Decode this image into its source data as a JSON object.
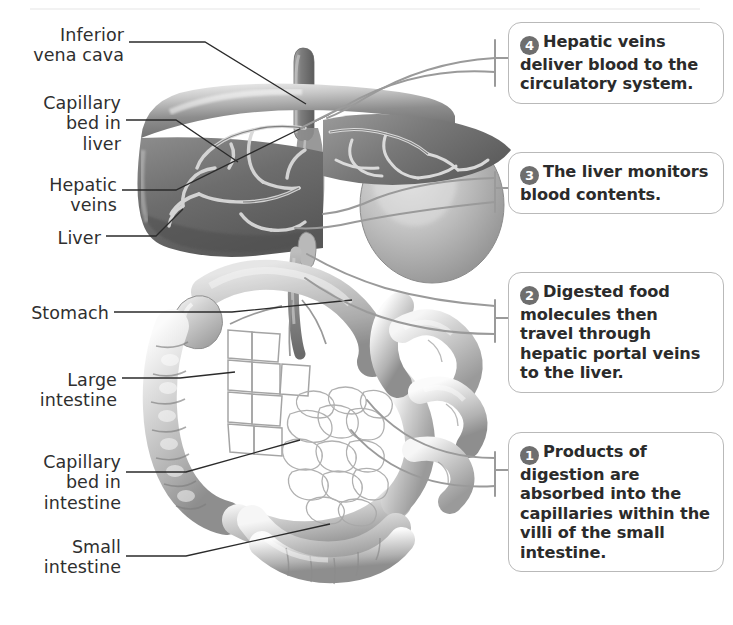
{
  "figure": {
    "background_color": "#ffffff",
    "label_color": "#2f2f2f",
    "badge_color": "#6e6e6e",
    "callout_border_color": "#b9b9b9",
    "leader_line_color": "#2b2b2b",
    "callout_leader_color": "#8c8c8c"
  },
  "labels": [
    {
      "id": "inferior-vena-cava",
      "text": "Inferior\nvena cava"
    },
    {
      "id": "capillary-bed-in-liver",
      "text": "Capillary\nbed in\nliver"
    },
    {
      "id": "hepatic-veins",
      "text": "Hepatic\nveins"
    },
    {
      "id": "liver",
      "text": "Liver"
    },
    {
      "id": "stomach",
      "text": "Stomach"
    },
    {
      "id": "large-intestine",
      "text": "Large\nintestine"
    },
    {
      "id": "capillary-bed-in-intestine",
      "text": "Capillary\nbed in\nintestine"
    },
    {
      "id": "small-intestine",
      "text": "Small\nintestine"
    }
  ],
  "callouts": [
    {
      "id": "callout-4",
      "number": "4",
      "text": "Hepatic veins deliver blood to the circulatory system."
    },
    {
      "id": "callout-3",
      "number": "3",
      "text": "The liver monitors blood contents."
    },
    {
      "id": "callout-2",
      "number": "2",
      "text": "Digested food molecules then travel through hepatic portal veins to the liver."
    },
    {
      "id": "callout-1",
      "number": "1",
      "text": "Products of digestion are absorbed into the capillaries within the villi of the small intestine."
    }
  ]
}
